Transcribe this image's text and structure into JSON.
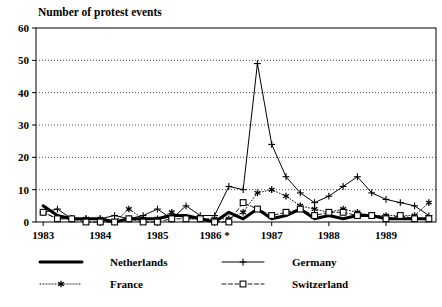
{
  "chart_data": {
    "type": "line",
    "title": "Number of protest events",
    "xlabel": "",
    "ylabel": "",
    "ylim": [
      0,
      60
    ],
    "yticks": [
      0,
      10,
      20,
      30,
      40,
      50,
      60
    ],
    "grid": true,
    "legend_position": "bottom",
    "x_tick_labels": [
      "1983",
      "1984",
      "1985",
      "1986 *",
      "1987",
      "1988",
      "1989"
    ],
    "x_note": "quarterly observations, 1983 Q1 through 1989 Q4",
    "x": [
      "1983 Q1",
      "1983 Q2",
      "1983 Q3",
      "1983 Q4",
      "1984 Q1",
      "1984 Q2",
      "1984 Q3",
      "1984 Q4",
      "1985 Q1",
      "1985 Q2",
      "1985 Q3",
      "1985 Q4",
      "1986 Q1",
      "1986 Q2",
      "1986 Q3",
      "1986 Q4",
      "1987 Q1",
      "1987 Q2",
      "1987 Q3",
      "1987 Q4",
      "1988 Q1",
      "1988 Q2",
      "1988 Q3",
      "1988 Q4",
      "1989 Q1",
      "1989 Q2",
      "1989 Q3",
      "1989 Q4"
    ],
    "series": [
      {
        "name": "Netherlands",
        "style": "thick-solid",
        "marker": "none",
        "color": "#000000",
        "values": [
          5,
          2,
          1,
          1,
          1,
          0,
          1,
          1,
          1,
          2,
          2,
          1,
          0,
          3,
          1,
          4,
          1,
          2,
          4,
          1,
          2,
          1,
          2,
          2,
          1,
          1,
          1,
          1
        ]
      },
      {
        "name": "Germany",
        "style": "thin-solid",
        "marker": "plus",
        "color": "#000000",
        "values": [
          3,
          4,
          1,
          1,
          1,
          2,
          1,
          2,
          4,
          1,
          5,
          2,
          2,
          11,
          10,
          49,
          24,
          14,
          9,
          6,
          8,
          11,
          14,
          9,
          7,
          6,
          5,
          2
        ]
      },
      {
        "name": "France",
        "style": "dotted",
        "marker": "asterisk",
        "color": "#000000",
        "values": [
          3,
          1,
          1,
          1,
          1,
          0,
          4,
          1,
          1,
          3,
          1,
          1,
          1,
          1,
          3,
          9,
          10,
          8,
          5,
          4,
          3,
          4,
          3,
          2,
          2,
          2,
          2,
          6
        ]
      },
      {
        "name": "Switzerland",
        "style": "dashed",
        "marker": "open-square",
        "color": "#000000",
        "values": [
          3,
          1,
          1,
          0,
          0,
          0,
          1,
          0,
          0,
          1,
          1,
          1,
          0,
          0,
          6,
          4,
          2,
          3,
          4,
          2,
          3,
          3,
          2,
          2,
          1,
          2,
          1,
          1
        ]
      }
    ]
  },
  "legend": {
    "items": [
      {
        "label": "Netherlands",
        "marker": "thick-line"
      },
      {
        "label": "Germany",
        "marker": "plus"
      },
      {
        "label": "France",
        "marker": "asterisk"
      },
      {
        "label": "Switzerland",
        "marker": "open-square"
      }
    ]
  }
}
